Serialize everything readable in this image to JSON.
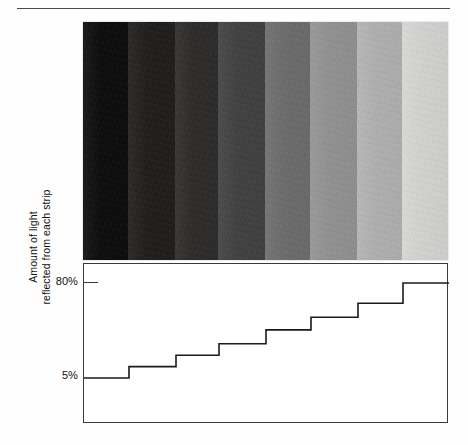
{
  "figure": {
    "kind": "grayscale-step-wedge-with-reflectance-plot",
    "top_rule": true,
    "bottom_rule": true
  },
  "axis": {
    "title": "Amount of light\nreflected from each strip",
    "title_line1": "Amount of light",
    "title_line2": "reflected from each strip",
    "ticks": [
      {
        "label": "80%",
        "value": 80
      },
      {
        "label": "5%",
        "value": 5
      }
    ]
  },
  "strips": [
    {
      "index": 1,
      "reflectance": 5,
      "label": "5%",
      "color": "#090909"
    },
    {
      "index": 2,
      "reflectance": 14,
      "label": "14%",
      "color": "#1e1c1b"
    },
    {
      "index": 3,
      "reflectance": 23,
      "label": "23%",
      "color": "#2b2a29"
    },
    {
      "index": 4,
      "reflectance": 32,
      "label": "32%",
      "color": "#404040"
    },
    {
      "index": 5,
      "reflectance": 43,
      "label": "43%",
      "color": "#6d6d6d"
    },
    {
      "index": 6,
      "reflectance": 53,
      "label": "53%",
      "color": "#949494"
    },
    {
      "index": 7,
      "reflectance": 64,
      "label": "64%",
      "color": "#b4b4b4"
    },
    {
      "index": 8,
      "reflectance": 80,
      "label": "80%",
      "color": "#d8d8d6"
    }
  ],
  "chart_data": {
    "type": "line",
    "subtype": "step",
    "title": "",
    "xlabel": "",
    "ylabel": "Amount of light reflected from each strip",
    "categories": [
      "1",
      "2",
      "3",
      "4",
      "5",
      "6",
      "7",
      "8"
    ],
    "values": [
      5,
      14,
      23,
      32,
      43,
      53,
      64,
      80
    ],
    "ylim": [
      0,
      88
    ],
    "xlim": [
      0,
      8
    ],
    "tick_labels_y": [
      "5%",
      "80%"
    ],
    "tick_values_y": [
      5,
      80
    ],
    "grid": false,
    "legend": false,
    "step_boundaries_px": [
      128,
      175,
      218,
      265,
      310,
      357,
      402
    ],
    "line_color": "#1a1a1a",
    "line_width": 1.6
  },
  "colors": {
    "rule": "#4a4a4a",
    "plot_border": "#3a3a3a",
    "line": "#1a1a1a",
    "text": "#111111",
    "background": "#ffffff"
  }
}
